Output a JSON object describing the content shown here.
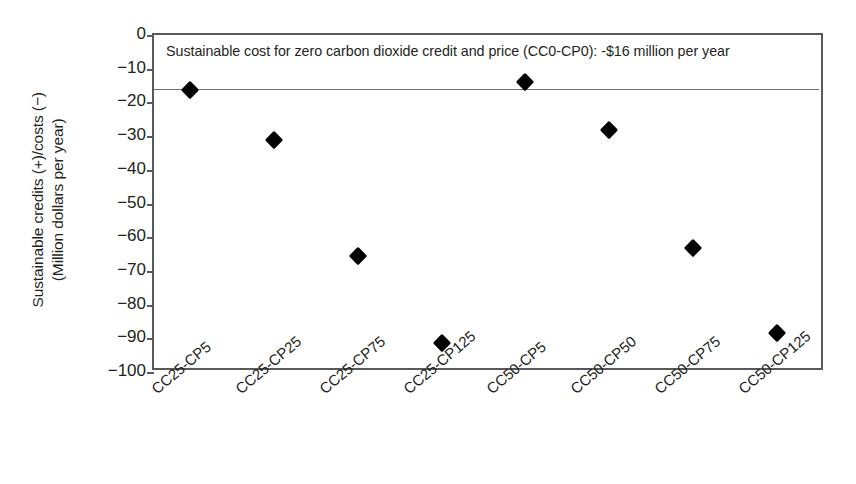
{
  "chart_data": {
    "type": "scatter",
    "title": "",
    "xlabel": "",
    "ylabel_line1": "Sustainable credits (+)/costs (−)",
    "ylabel_line2": "(Million dollars per year)",
    "categories": [
      "CC25-CP5",
      "CC25-CP25",
      "CC25-CP75",
      "CC25-CP125",
      "CC50-CP5",
      "CC50-CP50",
      "CC50-CP75",
      "CC50-CP125"
    ],
    "values": [
      -16.2,
      -31.3,
      -65.5,
      -91.5,
      -13.8,
      -28.3,
      -63.3,
      -88.5
    ],
    "ylim": [
      -100,
      0
    ],
    "yticks": [
      0,
      -10,
      -20,
      -30,
      -40,
      -50,
      -60,
      -70,
      -80,
      -90,
      -100
    ],
    "ytick_labels": [
      "0",
      "−10",
      "−20",
      "−30",
      "−40",
      "−50",
      "−60",
      "−70",
      "−80",
      "−90",
      "−100"
    ],
    "grid": false,
    "legend": "none",
    "marker_shape": "filled-diamond",
    "marker_color": "#000000",
    "annotations": [
      {
        "text": "Sustainable cost for zero carbon dioxide credit and price (CC0-CP0): -$16 million per year",
        "position": "top-inside-left"
      }
    ],
    "reference_line": {
      "label": "Sustainable cost for zero carbon dioxide credit and price (CC0-CP0)",
      "value": -16,
      "color": "#6d6e71",
      "style": "solid"
    }
  },
  "colors": {
    "axis": "#58595b",
    "text": "#231f20",
    "marker": "#000000",
    "reference_line": "#6d6e71",
    "background": "#ffffff"
  }
}
